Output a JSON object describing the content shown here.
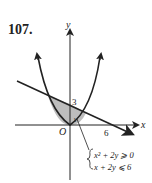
{
  "problem_number": "107.",
  "axes": {
    "x_label": "x",
    "y_label": "y",
    "origin_label": "O"
  },
  "ticks": {
    "y_intercept": "3",
    "x_intercept": "6",
    "point_label": "1"
  },
  "system": {
    "line1": "x² + 2y ⩾ 0",
    "line2": "x + 2y ⩽ 6"
  },
  "notes": {
    "curve": "Upward-opening parabola through the origin; exact coefficient not measured from the figure.",
    "label_discrepancy": "Printed inequality x² + 2y ⩾ 0 describes a downward parabola; the drawn curve opens upward with shading above it, consistent with x² − 2y ⩽ 0. Label reproduced verbatim."
  },
  "colors": {
    "shade": "#bdbdbd",
    "stroke": "#222222"
  }
}
